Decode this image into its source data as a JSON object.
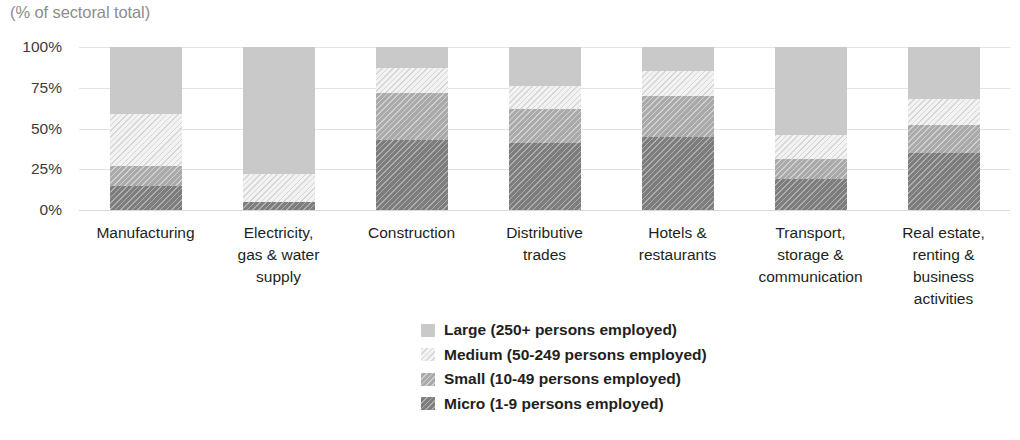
{
  "axis_title": "(% of sectoral total)",
  "chart_data": {
    "type": "bar",
    "stacked": true,
    "stack_mode": "percent",
    "title": "",
    "subtitle": "",
    "xlabel": "",
    "ylabel": "(% of sectoral total)",
    "ylim": [
      0,
      100
    ],
    "ytick_labels": [
      "0%",
      "25%",
      "50%",
      "75%",
      "100%"
    ],
    "ytick_values": [
      0,
      25,
      50,
      75,
      100
    ],
    "grid": true,
    "legend_position": "bottom-center",
    "categories": [
      "Manufacturing",
      "Electricity,\ngas & water\nsupply",
      "Construction",
      "Distributive\ntrades",
      "Hotels &\nrestaurants",
      "Transport,\nstorage &\ncommunication",
      "Real estate,\nrenting &\nbusiness\nactivities"
    ],
    "series": [
      {
        "name": "Micro (1-9 persons employed)",
        "key": "micro",
        "color": "#7d7d7d",
        "values": [
          15,
          5,
          43,
          41,
          45,
          19,
          35
        ]
      },
      {
        "name": "Small (10-49 persons employed)",
        "key": "small",
        "color": "#aaaaaa",
        "values": [
          12,
          0,
          29,
          21,
          25,
          12,
          17
        ]
      },
      {
        "name": "Medium (50-249 persons employed)",
        "key": "medium",
        "color": "#f2f2f2",
        "values": [
          32,
          17,
          15,
          14,
          15,
          15,
          16
        ]
      },
      {
        "name": "Large (250+ persons employed)",
        "key": "large",
        "color": "#c9c9c9",
        "values": [
          41,
          78,
          13,
          24,
          15,
          54,
          32
        ]
      }
    ]
  },
  "legend": {
    "items": [
      {
        "label": "Large (250+ persons employed)",
        "key": "large"
      },
      {
        "label": "Medium (50-249 persons employed)",
        "key": "medium"
      },
      {
        "label": "Small (10-49 persons employed)",
        "key": "small"
      },
      {
        "label": "Micro (1-9 persons employed)",
        "key": "micro"
      }
    ]
  }
}
